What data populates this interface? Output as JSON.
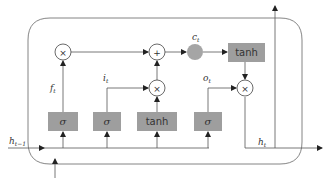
{
  "diagram": {
    "type": "LSTM cell",
    "colors": {
      "gate_fill": "#9e9e9e",
      "cell_state_fill": "#a5a5a5",
      "line": "#555555",
      "border": "#666666"
    },
    "gates": [
      {
        "id": "forget",
        "label": "σ",
        "output_label": "f",
        "output_sub": "t"
      },
      {
        "id": "input",
        "label": "σ",
        "output_label": "i",
        "output_sub": "t"
      },
      {
        "id": "candidate",
        "label": "tanh"
      },
      {
        "id": "output",
        "label": "σ",
        "output_label": "o",
        "output_sub": "t"
      }
    ],
    "ops": {
      "mul": "×",
      "add": "+"
    },
    "cell_state": {
      "label": "c",
      "sub": "t"
    },
    "cell_tanh": {
      "label": "tanh"
    },
    "inputs": {
      "h_prev": {
        "label": "h",
        "sub": "t−1"
      }
    },
    "outputs": {
      "h": {
        "label": "h",
        "sub": "t"
      }
    }
  }
}
